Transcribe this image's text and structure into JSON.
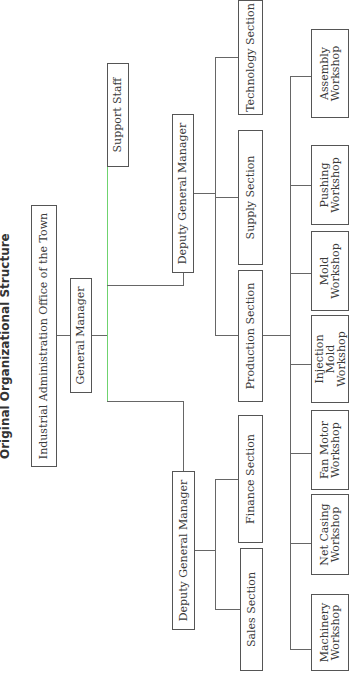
{
  "title": "Original Organizational Structure",
  "colors": {
    "line": "#666666",
    "accent_line": "#6fd36f",
    "box_border": "#555555"
  },
  "nodes": {
    "office": "Industrial Administration Office of the Town",
    "general_manager": "General Manager",
    "support_staff": "Support Staff",
    "dgm_left": "Deputy General Manager",
    "dgm_right": "Deputy General Manager",
    "sales": "Sales Section",
    "finance": "Finance Section",
    "production": "Production Section",
    "supply": "Supply Section",
    "technology": "Technology Section"
  },
  "workshops": [
    {
      "line1": "Machinery",
      "line2": "Workshop"
    },
    {
      "line1": "Net Casing",
      "line2": "Workshop"
    },
    {
      "line1": "Fan Motor",
      "line2": "Workshop"
    },
    {
      "line1": "Injection",
      "line2": "Mold Workshop"
    },
    {
      "line1": "Mold",
      "line2": "Workshop"
    },
    {
      "line1": "Pushing",
      "line2": "Workshop"
    },
    {
      "line1": "Assembly",
      "line2": "Workshop"
    }
  ]
}
